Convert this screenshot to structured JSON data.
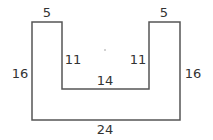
{
  "diagram": {
    "type": "u-shape-dimensioned",
    "stroke_color": "#555555",
    "text_color": "#333333",
    "shape_points": [
      [
        32,
        22
      ],
      [
        62,
        22
      ],
      [
        62,
        89
      ],
      [
        149,
        89
      ],
      [
        149,
        22
      ],
      [
        180,
        22
      ],
      [
        180,
        120
      ],
      [
        32,
        120
      ]
    ],
    "labels": {
      "top_left_width": "5",
      "top_right_width": "5",
      "left_height": "16",
      "right_height": "16",
      "inner_left_height": "11",
      "inner_right_height": "11",
      "inner_bottom_width": "14",
      "bottom_width": "24"
    },
    "center_dot": true
  }
}
